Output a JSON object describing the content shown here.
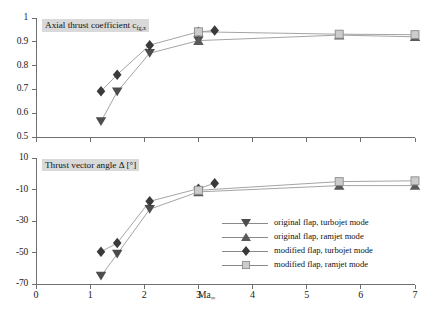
{
  "figure": {
    "x_axis": {
      "label": "Ma",
      "label_sub": "∞",
      "min": 0,
      "max": 7,
      "ticks": [
        0,
        1,
        2,
        3,
        4,
        5,
        6,
        7
      ],
      "tick_labels": [
        "0",
        "1",
        "2",
        "3",
        "4",
        "5",
        "6",
        "7"
      ]
    },
    "panels": [
      {
        "id": "axial-thrust-coefficient",
        "title": "Axial thrust coefficient c",
        "title_sub": "fg,x",
        "ylim": [
          0.5,
          1.0
        ],
        "yticks": [
          0.5,
          0.6,
          0.7,
          0.8,
          0.9,
          1.0
        ],
        "ytick_labels": [
          "0.5",
          "0.6",
          "0.7",
          "0.8",
          "0.9",
          "1"
        ]
      },
      {
        "id": "thrust-vector-angle",
        "title": "Thrust vector angle Δ [°]",
        "ylim": [
          -70,
          10
        ],
        "yticks": [
          -70,
          -50,
          -30,
          -10,
          10
        ],
        "ytick_labels": [
          "-70",
          "-50",
          "-30",
          "-10",
          "10"
        ]
      }
    ]
  },
  "legend": {
    "items": [
      {
        "label": "original flap, turbojet mode",
        "marker": "triangle-down",
        "color": "#4d4d4d"
      },
      {
        "label": "original flap, ramjet mode",
        "marker": "triangle-up",
        "color": "#5a5a5a"
      },
      {
        "label": "modified flap, turbojet mode",
        "marker": "diamond",
        "color": "#3a3a3a"
      },
      {
        "label": "modified flap, ramjet mode",
        "marker": "square",
        "color": "#cccccc"
      }
    ]
  },
  "chart_data": [
    {
      "type": "line",
      "id": "axial-thrust-coefficient",
      "title": "Axial thrust coefficient c_fg,x",
      "xlabel": "Ma∞",
      "ylabel": "Axial thrust coefficient c_fg,x",
      "xlim": [
        0,
        7
      ],
      "ylim": [
        0.5,
        1.0
      ],
      "grid": false,
      "legend_position": "bottom-right (shared)",
      "series": [
        {
          "name": "original flap, turbojet mode",
          "marker": "triangle-down",
          "color": "#4d4d4d",
          "x": [
            1.2,
            1.5,
            2.1,
            3.0
          ],
          "y": [
            0.565,
            0.69,
            0.852,
            0.905
          ]
        },
        {
          "name": "original flap, ramjet mode",
          "marker": "triangle-up",
          "color": "#5a5a5a",
          "x": [
            3.0,
            5.6,
            7.0
          ],
          "y": [
            0.905,
            0.928,
            0.921
          ]
        },
        {
          "name": "modified flap, turbojet mode",
          "marker": "diamond",
          "color": "#3a3a3a",
          "x": [
            1.2,
            1.5,
            2.1,
            3.0,
            3.3
          ],
          "y": [
            0.692,
            0.762,
            0.886,
            0.942,
            0.947
          ]
        },
        {
          "name": "modified flap, ramjet mode",
          "marker": "square",
          "color": "#cccccc",
          "x": [
            3.0,
            5.6,
            7.0
          ],
          "y": [
            0.942,
            0.932,
            0.93
          ]
        }
      ]
    },
    {
      "type": "line",
      "id": "thrust-vector-angle",
      "title": "Thrust vector angle Δ [°]",
      "xlabel": "Ma∞",
      "ylabel": "Thrust vector angle Δ [°]",
      "xlim": [
        0,
        7
      ],
      "ylim": [
        -70,
        10
      ],
      "grid": false,
      "legend_position": "bottom-right (shared)",
      "series": [
        {
          "name": "original flap, turbojet mode",
          "marker": "triangle-down",
          "color": "#4d4d4d",
          "x": [
            1.2,
            1.5,
            2.1,
            3.0
          ],
          "y": [
            -65.0,
            -51.0,
            -22.5,
            -11.5
          ]
        },
        {
          "name": "original flap, ramjet mode",
          "marker": "triangle-up",
          "color": "#5a5a5a",
          "x": [
            3.0,
            5.6,
            7.0
          ],
          "y": [
            -11.5,
            -7.5,
            -7.5
          ]
        },
        {
          "name": "modified flap, turbojet mode",
          "marker": "diamond",
          "color": "#3a3a3a",
          "x": [
            1.2,
            1.5,
            2.1,
            3.0,
            3.3
          ],
          "y": [
            -49.5,
            -44.0,
            -17.5,
            -9.5,
            -6.0
          ]
        },
        {
          "name": "modified flap, ramjet mode",
          "marker": "square",
          "color": "#cccccc",
          "x": [
            3.0,
            5.6,
            7.0
          ],
          "y": [
            -10.5,
            -5.0,
            -4.5
          ]
        }
      ]
    }
  ]
}
